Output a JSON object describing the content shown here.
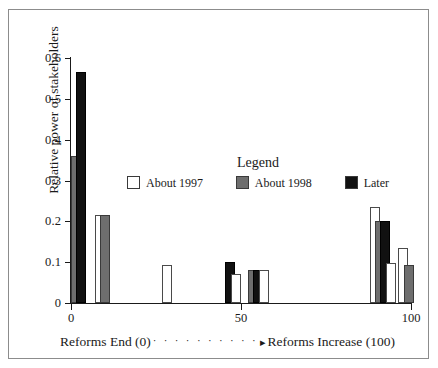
{
  "chart_data": {
    "type": "bar",
    "title": "",
    "xlabel": "Reforms End (0)  ···········▸ Reforms Increase (100)",
    "xlabel_left": "Reforms End (0)",
    "xlabel_dots": "· · · · · · · · · ·",
    "xlabel_arrow": "▸",
    "xlabel_right": "Reforms Increase (100)",
    "ylabel": "Relative power of stakeholders",
    "xlim": [
      0,
      100
    ],
    "ylim": [
      0,
      0.6
    ],
    "grid": false,
    "xticks": [
      0,
      50,
      100
    ],
    "xtick_labels": [
      "0",
      "50",
      "100"
    ],
    "yticks": [
      0,
      0.1,
      0.2,
      0.3,
      0.4,
      0.5,
      0.6
    ],
    "ytick_labels": [
      "0",
      "0.1",
      "0.2",
      "0.3",
      "0.4",
      "0.5",
      "0.6"
    ],
    "legend": {
      "title": "Legend",
      "position": "inside-center",
      "entries": [
        {
          "name": "About 1997",
          "color": "#ffffff",
          "style": "white"
        },
        {
          "name": "About 1998",
          "color": "#6e6e6e",
          "style": "gray"
        },
        {
          "name": "Later",
          "color": "#111111",
          "style": "black"
        }
      ]
    },
    "bars": [
      {
        "label": "About 1998",
        "style": "gray",
        "x": 0.0,
        "value": 0.36
      },
      {
        "label": "Later",
        "style": "black",
        "x": 1.6,
        "value": 0.565
      },
      {
        "label": "About 1997",
        "style": "white",
        "x": 7.0,
        "value": 0.215
      },
      {
        "label": "About 1998",
        "style": "gray",
        "x": 8.6,
        "value": 0.215
      },
      {
        "label": "About 1997",
        "style": "white",
        "x": 26.8,
        "value": 0.093
      },
      {
        "label": "Later",
        "style": "black",
        "x": 45.4,
        "value": 0.101
      },
      {
        "label": "About 1997",
        "style": "white",
        "x": 47.0,
        "value": 0.07
      },
      {
        "label": "About 1998",
        "style": "gray",
        "x": 52.0,
        "value": 0.082
      },
      {
        "label": "Later",
        "style": "black",
        "x": 53.6,
        "value": 0.082
      },
      {
        "label": "About 1997",
        "style": "white",
        "x": 55.2,
        "value": 0.082
      },
      {
        "label": "About 1997",
        "style": "white",
        "x": 87.8,
        "value": 0.234
      },
      {
        "label": "About 1998",
        "style": "gray",
        "x": 89.4,
        "value": 0.201
      },
      {
        "label": "Later",
        "style": "black",
        "x": 91.0,
        "value": 0.201
      },
      {
        "label": "About 1997",
        "style": "white",
        "x": 92.6,
        "value": 0.098
      },
      {
        "label": "About 1997",
        "style": "white",
        "x": 96.2,
        "value": 0.135
      },
      {
        "label": "About 1998",
        "style": "gray",
        "x": 97.8,
        "value": 0.093
      }
    ],
    "bar_pixel_width": 10
  }
}
